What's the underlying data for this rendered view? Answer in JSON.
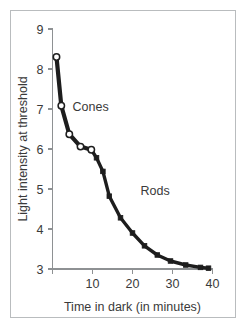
{
  "figure": {
    "frame_color": "#b9bcbe",
    "background_color": "#ffffff"
  },
  "chart_data": {
    "type": "line",
    "title": "",
    "subtitle": "",
    "xlabel": "Time in dark (in minutes)",
    "ylabel": "Light intensity at threshold",
    "xlim": [
      0,
      40
    ],
    "ylim": [
      3,
      9
    ],
    "xticks": [
      10,
      20,
      30,
      40
    ],
    "xtick_labels": [
      "10",
      "20",
      "30",
      "40"
    ],
    "yticks": [
      3,
      4,
      5,
      6,
      7,
      8,
      9
    ],
    "ytick_labels": [
      "3",
      "4",
      "5",
      "6",
      "7",
      "8",
      "9"
    ],
    "grid": false,
    "legend": "none",
    "annotations": [
      {
        "text": "Cones",
        "x": 5.0,
        "y": 6.95
      },
      {
        "text": "Rods",
        "x": 22.0,
        "y": 4.85
      }
    ],
    "series": [
      {
        "name": "Cones",
        "marker": "open-circle",
        "x": [
          1.0,
          2.2,
          4.2,
          7.0,
          9.7
        ],
        "values": [
          8.3,
          7.08,
          6.37,
          6.06,
          5.98
        ]
      },
      {
        "name": "Rods",
        "marker": "filled-square",
        "x": [
          9.7,
          11.0,
          12.6,
          14.2,
          17.0,
          20.0,
          23.0,
          26.2,
          29.5,
          33.3,
          37.0,
          39.0
        ],
        "values": [
          5.98,
          5.78,
          5.44,
          4.82,
          4.28,
          3.9,
          3.58,
          3.35,
          3.2,
          3.1,
          3.04,
          3.02
        ]
      }
    ]
  }
}
